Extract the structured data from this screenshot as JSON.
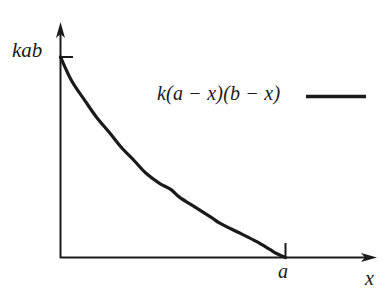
{
  "figure": {
    "background_color": "#ffffff",
    "ink_color": "#1a1a1a"
  },
  "axes": {
    "y_axis": {
      "name": "vertical-axis",
      "label": "kab",
      "tick_label": "kab",
      "has_arrowhead": true
    },
    "x_axis": {
      "name": "horizontal-axis",
      "label": "x",
      "has_arrowhead": true,
      "ticks": [
        {
          "label": "a",
          "position_fraction": 1.0
        }
      ]
    }
  },
  "legend": {
    "position": "upper-right",
    "entries": [
      {
        "label": "k(a − x)(b − x)",
        "swatch": "solid-line",
        "color": "#1a1a1a"
      }
    ]
  },
  "chart_data": {
    "type": "line",
    "title": "",
    "subtitle": "",
    "xlabel": "x",
    "ylabel": "kab",
    "grid": false,
    "legend_position": "upper-right",
    "xlim": [
      0,
      1.43
    ],
    "ylim": [
      0,
      1.0
    ],
    "x_tick_labels": [
      "a"
    ],
    "x_tick_values": [
      1.0
    ],
    "y_tick_labels": [
      "kab"
    ],
    "y_tick_values": [
      1.0
    ],
    "series": [
      {
        "name": "k(a − x)(b − x)",
        "color": "#1a1a1a",
        "linewidth": 3,
        "x": [
          0.0,
          0.05,
          0.11,
          0.16,
          0.22,
          0.27,
          0.33,
          0.38,
          0.44,
          0.49,
          0.53,
          0.6,
          0.67,
          0.71,
          0.8,
          0.87,
          0.93,
          0.96,
          1.0
        ],
        "y": [
          1.0,
          0.88,
          0.78,
          0.7,
          0.62,
          0.55,
          0.48,
          0.42,
          0.37,
          0.34,
          0.3,
          0.25,
          0.2,
          0.17,
          0.12,
          0.08,
          0.04,
          0.02,
          0.0
        ]
      }
    ],
    "annotations": [
      {
        "text": "kab",
        "axis": "y",
        "value": 1.0
      },
      {
        "text": "a",
        "axis": "x",
        "value": 1.0
      }
    ]
  }
}
